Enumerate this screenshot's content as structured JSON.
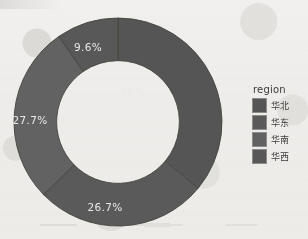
{
  "chart_data": {
    "type": "pie",
    "variant": "donut",
    "title": "",
    "categories": [
      "华北",
      "华东",
      "华南",
      "华西"
    ],
    "values": [
      36,
      26.7,
      27.7,
      9.6
    ],
    "labels": [
      "36%",
      "26.7%",
      "27.7%",
      "9.6%"
    ],
    "colors": [
      "#555555",
      "#5a5a5a",
      "#626262",
      "#585858"
    ],
    "legend_title": "region",
    "legend_position": "right",
    "start_angle_deg": 0,
    "direction": "clockwise",
    "inner_radius_ratio": 0.59,
    "grid": false,
    "xlabel": "",
    "ylabel": ""
  },
  "legend": {
    "title": "region",
    "items": [
      {
        "label": "华北",
        "color": "#555555"
      },
      {
        "label": "华东",
        "color": "#5a5a5a"
      },
      {
        "label": "华南",
        "color": "#626262"
      },
      {
        "label": "华西",
        "color": "#585858"
      }
    ]
  },
  "slices": [
    {
      "label": "36%",
      "value": 36,
      "category": "华北",
      "color": "#555555",
      "lx": 120,
      "ly": 76
    },
    {
      "label": "26.7%",
      "value": 26.7,
      "category": "华东",
      "color": "#5a5a5a",
      "lx": 92,
      "ly": 191
    },
    {
      "label": "27.7%",
      "value": 27.7,
      "category": "华南",
      "color": "#626262",
      "lx": 17,
      "ly": 104
    },
    {
      "label": "9.6%",
      "value": 9.6,
      "category": "华西",
      "color": "#585858",
      "lx": 75,
      "ly": 31
    }
  ],
  "canvas": {
    "background": "#f1f0ee",
    "label_text_color": "#e9e9e7",
    "legend_text_color": "#3c3c3b"
  }
}
